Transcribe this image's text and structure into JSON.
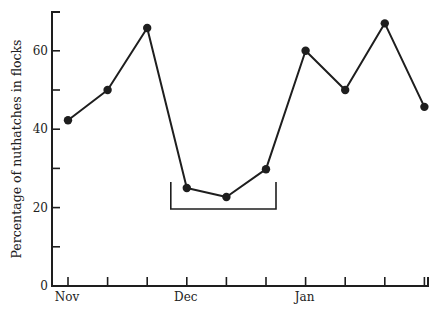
{
  "chart_data": {
    "type": "line",
    "title": "",
    "xlabel": "",
    "ylabel": "Percentage of nuthatches in flocks",
    "ylim": [
      0,
      70
    ],
    "yticks_major": [
      0,
      20,
      40,
      60
    ],
    "yticks_minor": [
      10,
      30,
      50
    ],
    "grid": false,
    "legend": null,
    "x_tick_labels": [
      {
        "index": 0,
        "label": "Nov"
      },
      {
        "index": 3,
        "label": "Dec"
      },
      {
        "index": 6,
        "label": "Jan"
      }
    ],
    "x": [
      0,
      1,
      2,
      3,
      4,
      5,
      6,
      7,
      8,
      9
    ],
    "series": [
      {
        "name": "Percentage in flocks",
        "values": [
          42.3,
          50,
          65.8,
          25,
          22.7,
          29.8,
          60,
          50,
          67,
          45.7
        ]
      }
    ],
    "annotations": [
      {
        "type": "bracket",
        "spans_x": [
          3,
          5
        ],
        "note": "bracket beneath the three December low points"
      }
    ]
  }
}
